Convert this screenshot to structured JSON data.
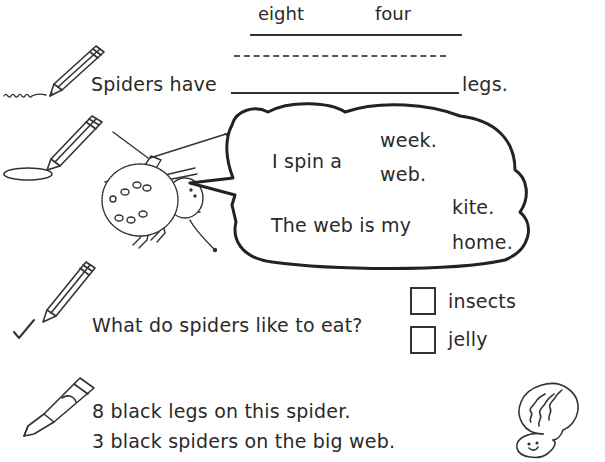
{
  "word_bank": {
    "words": [
      "eight",
      "four"
    ]
  },
  "q1": {
    "prefix": "Spiders have",
    "suffix": "legs.",
    "answer": ""
  },
  "q2": {
    "sentence1": {
      "prefix": "I spin a",
      "options": [
        "week.",
        "web."
      ]
    },
    "sentence2": {
      "prefix": "The web is my",
      "options": [
        "kite.",
        "home."
      ]
    }
  },
  "q3": {
    "question": "What do spiders like to eat?",
    "options": [
      {
        "label": "insects",
        "checked": false
      },
      {
        "label": "jelly",
        "checked": false
      }
    ]
  },
  "q4": {
    "lines": [
      "8 black legs on this spider.",
      "3 black spiders on the big web."
    ]
  },
  "icons": {
    "q1": "pencil-write-icon",
    "q2": "pencil-circle-icon",
    "q3": "pencil-check-icon",
    "q4": "crayon-icon",
    "thinking": "thinking-head-icon",
    "illustration": "spider-illustration"
  }
}
